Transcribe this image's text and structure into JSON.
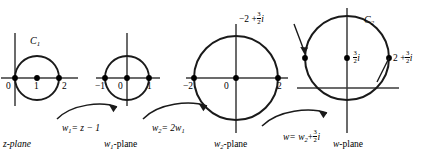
{
  "figure": {
    "stroke_color": "#1a1a1a",
    "axis_color": "#3a3a3a",
    "point_color": "#000000"
  },
  "planes": [
    {
      "id": "z-plane",
      "name": "z-plane",
      "curve_label": "C",
      "curve_label_sub": "1",
      "circle": {
        "center_re": 1,
        "center_im": 0,
        "radius": 1
      },
      "ticks": [
        {
          "label": "0",
          "value": 0
        },
        {
          "label": "1",
          "value": 1
        },
        {
          "label": "2",
          "value": 2
        }
      ],
      "marked_points": [
        "0",
        "1",
        "2"
      ]
    },
    {
      "id": "w1-plane",
      "name": "w",
      "name_sub": "1",
      "name_suffix": "-plane",
      "circle": {
        "center_re": 0,
        "center_im": 0,
        "radius": 1
      },
      "ticks": [
        {
          "label": "−1",
          "value": -1
        },
        {
          "label": "0",
          "value": 0
        },
        {
          "label": "1",
          "value": 1
        }
      ],
      "marked_points": [
        "-1",
        "0",
        "1"
      ]
    },
    {
      "id": "w2-plane",
      "name": "w",
      "name_sub": "2",
      "name_suffix": "-plane",
      "circle": {
        "center_re": 0,
        "center_im": 0,
        "radius": 2
      },
      "ticks": [
        {
          "label": "−2",
          "value": -2
        },
        {
          "label": "0",
          "value": 0
        },
        {
          "label": "2",
          "value": 2
        }
      ],
      "marked_points": [
        "-2",
        "0",
        "2"
      ]
    },
    {
      "id": "w-plane",
      "name": "w-plane",
      "curve_label": "C",
      "curve_label_sub": "2",
      "circle": {
        "center_re": 0,
        "center_im": 1.5,
        "radius": 2
      },
      "point_labels": [
        {
          "text_prefix": "−2 +",
          "frac_num": "3",
          "frac_den": "2",
          "text_suffix": "i"
        },
        {
          "text_prefix": "",
          "frac_num": "3",
          "frac_den": "2",
          "text_suffix": "i"
        },
        {
          "text_prefix": "2 +",
          "frac_num": "3",
          "frac_den": "2",
          "text_suffix": "i"
        }
      ]
    }
  ],
  "mappings": [
    {
      "id": "map-1",
      "lhs": "w",
      "lhs_sub": "1",
      "rhs": "= z − 1"
    },
    {
      "id": "map-2",
      "lhs": "w",
      "lhs_sub": "2",
      "rhs": "= 2w",
      "rhs_sub": "1"
    },
    {
      "id": "map-3",
      "lhs": "w",
      "rhs_prefix": "= w",
      "rhs_sub": "2",
      "rhs_plus": "+",
      "frac_num": "3",
      "frac_den": "2",
      "rhs_suffix": "i"
    }
  ]
}
